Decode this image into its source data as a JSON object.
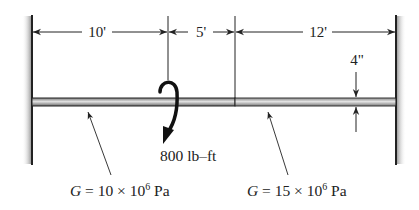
{
  "diagram": {
    "type": "stepped-shaft-torsion",
    "dimensions": {
      "segment_1": "10'",
      "segment_2": "5'",
      "segment_3": "12'",
      "diameter": "4\""
    },
    "applied_torque": {
      "label": "800 lb–ft",
      "direction": "clockwise-down"
    },
    "materials": {
      "left": {
        "symbol": "G",
        "eq": " = 10 × 10",
        "exp": "6",
        "unit": " Pa"
      },
      "right": {
        "symbol": "G",
        "eq": " = 15 × 10",
        "exp": "6",
        "unit": " Pa"
      }
    },
    "colors": {
      "line": "#222222",
      "shaft_left": "#b8b8b8",
      "shaft_right": "#c8c8c8",
      "wall_shade": "#9a9a9a"
    }
  }
}
